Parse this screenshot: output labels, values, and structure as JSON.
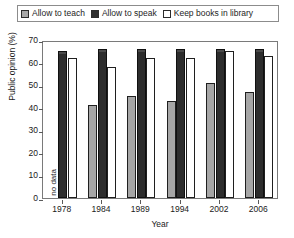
{
  "legend": {
    "entries": [
      {
        "label": "Allow to teach",
        "icon": "square-swatch-gray",
        "color": "#a6a6a6"
      },
      {
        "label": "Allow to speak",
        "icon": "square-swatch-black",
        "color": "#2d2d2d"
      },
      {
        "label": "Keep books in library",
        "icon": "square-swatch-white",
        "color": "#ffffff"
      }
    ]
  },
  "axes": {
    "y_title": "Public opinion (%)",
    "x_title": "Year",
    "y_ticks": [
      "0",
      "10",
      "20",
      "30",
      "40",
      "50",
      "60",
      "70"
    ],
    "y_min": 0,
    "y_max": 70,
    "y_step": 10
  },
  "annotations": {
    "no_data_label": "no data"
  },
  "chart_data": {
    "type": "bar",
    "title": "",
    "xlabel": "Year",
    "ylabel": "Public opinion (%)",
    "ylim": [
      0,
      70
    ],
    "ytick_step": 10,
    "grid": false,
    "legend_position": "top",
    "categories": [
      "1978",
      "1984",
      "1989",
      "1994",
      "2002",
      "2006"
    ],
    "series": [
      {
        "name": "Allow to teach",
        "color": "#a6a6a6",
        "values": [
          null,
          41,
          45,
          43,
          51,
          47
        ]
      },
      {
        "name": "Allow to speak",
        "color": "#2d2d2d",
        "values": [
          65,
          66,
          66,
          66,
          66,
          66
        ]
      },
      {
        "name": "Keep books in library",
        "color": "#ffffff",
        "values": [
          62,
          58,
          62,
          62,
          65,
          63
        ]
      }
    ],
    "notes": [
      {
        "category": "1978",
        "series": "Allow to teach",
        "text": "no data"
      }
    ]
  }
}
